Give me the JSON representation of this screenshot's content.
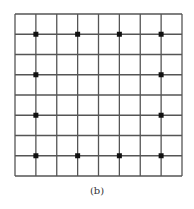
{
  "figure": {
    "caption": "(b)",
    "grid": {
      "rows": 8,
      "cols": 8,
      "left": 15,
      "top": 14,
      "right": 182,
      "bottom": 176,
      "line_color": "#555555",
      "line_width": 1.3
    },
    "dot_color": "#111111",
    "dot_size": 5,
    "dots": [
      {
        "col": 1,
        "row": 1
      },
      {
        "col": 3,
        "row": 1
      },
      {
        "col": 5,
        "row": 1
      },
      {
        "col": 7,
        "row": 1
      },
      {
        "col": 1,
        "row": 3
      },
      {
        "col": 7,
        "row": 3
      },
      {
        "col": 1,
        "row": 5
      },
      {
        "col": 7,
        "row": 5
      },
      {
        "col": 1,
        "row": 7
      },
      {
        "col": 3,
        "row": 7
      },
      {
        "col": 5,
        "row": 7
      },
      {
        "col": 7,
        "row": 7
      }
    ]
  }
}
